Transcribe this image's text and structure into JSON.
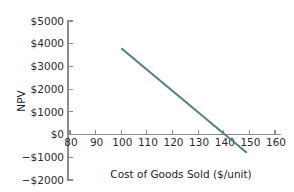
{
  "chart_data": {
    "type": "line",
    "title": "",
    "xlabel": "Cost of Goods Sold ($/unit)",
    "ylabel": "NPV",
    "xlim": [
      80,
      160
    ],
    "ylim": [
      -2000,
      5000
    ],
    "xticks": [
      80,
      90,
      100,
      110,
      120,
      130,
      140,
      150,
      160
    ],
    "xticklabels": [
      "80",
      "90",
      "100",
      "110",
      "120",
      "130",
      "140",
      "150",
      "160"
    ],
    "yticks": [
      -2000,
      -1000,
      0,
      1000,
      2000,
      3000,
      4000,
      5000
    ],
    "yticklabels": [
      "−$2000",
      "−$1000",
      "$0",
      "$1000",
      "$2000",
      "$3000",
      "$4000",
      "$5000"
    ],
    "grid": false,
    "legend": null,
    "series": [
      {
        "name": "NPV",
        "color": "#53808a",
        "x": [
          100,
          149
        ],
        "values": [
          3800,
          -800
        ]
      }
    ],
    "zero_crossing_x": 142,
    "slope_per_unit": -93.9,
    "axis_color": "#8c8c8c",
    "text_color": "#2b2b2b"
  }
}
